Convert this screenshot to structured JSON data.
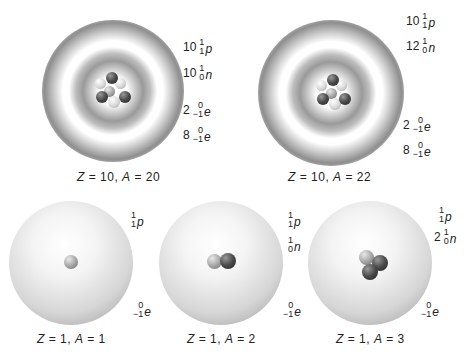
{
  "panels": [
    {
      "id": "neon-20",
      "caption": {
        "z": "10",
        "a": "20"
      },
      "particles": [
        {
          "coef": "10",
          "mass": "1",
          "charge": "1",
          "symbol": "p"
        },
        {
          "coef": "10",
          "mass": "1",
          "charge": "0",
          "symbol": "n"
        },
        {
          "coef": "2",
          "mass": "0",
          "charge": "−1",
          "symbol": "e"
        },
        {
          "coef": "8",
          "mass": "0",
          "charge": "−1",
          "symbol": "e"
        }
      ]
    },
    {
      "id": "neon-22",
      "caption": {
        "z": "10",
        "a": "22"
      },
      "particles": [
        {
          "coef": "10",
          "mass": "1",
          "charge": "1",
          "symbol": "p"
        },
        {
          "coef": "12",
          "mass": "1",
          "charge": "0",
          "symbol": "n"
        },
        {
          "coef": "2",
          "mass": "0",
          "charge": "−1",
          "symbol": "e"
        },
        {
          "coef": "8",
          "mass": "0",
          "charge": "−1",
          "symbol": "e"
        }
      ]
    },
    {
      "id": "hydrogen-1",
      "caption": {
        "z": "1",
        "a": "1"
      },
      "particles": [
        {
          "coef": "",
          "mass": "1",
          "charge": "1",
          "symbol": "p"
        },
        {
          "coef": "",
          "mass": "0",
          "charge": "−1",
          "symbol": "e"
        }
      ]
    },
    {
      "id": "hydrogen-2",
      "caption": {
        "z": "1",
        "a": "2"
      },
      "particles": [
        {
          "coef": "",
          "mass": "1",
          "charge": "1",
          "symbol": "p"
        },
        {
          "coef": "",
          "mass": "1",
          "charge": "0",
          "symbol": "n"
        },
        {
          "coef": "",
          "mass": "0",
          "charge": "−1",
          "symbol": "e"
        }
      ]
    },
    {
      "id": "hydrogen-3",
      "caption": {
        "z": "1",
        "a": "3"
      },
      "particles": [
        {
          "coef": "",
          "mass": "1",
          "charge": "1",
          "symbol": "p"
        },
        {
          "coef": "2",
          "mass": "1",
          "charge": "0",
          "symbol": "n"
        },
        {
          "coef": "",
          "mass": "0",
          "charge": "−1",
          "symbol": "e"
        }
      ]
    }
  ],
  "caption_labels": {
    "z": "Z",
    "a": "A",
    "eq": " = ",
    "sep": ", "
  }
}
